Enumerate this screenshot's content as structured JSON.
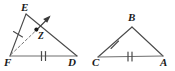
{
  "figure": {
    "background_color": "#ffffff",
    "stroke_color": "#4a4a4a",
    "label_color": "#1a1a1a",
    "triangles": [
      {
        "name": "triangle-EFD",
        "vertices": [
          {
            "label": "E",
            "x": 26,
            "y": 14
          },
          {
            "label": "F",
            "x": 10,
            "y": 56
          },
          {
            "label": "D",
            "x": 77,
            "y": 56
          }
        ],
        "sides": [
          {
            "from": "E",
            "to": "F",
            "ticks": 1
          },
          {
            "from": "F",
            "to": "D",
            "ticks": 2
          },
          {
            "from": "E",
            "to": "D",
            "ticks": 0
          }
        ],
        "interior_point": {
          "label": "Z",
          "x": 37,
          "y": 30
        },
        "ray": {
          "name": "angle-bisector-ray-F",
          "style": "dashed",
          "from": "F",
          "through": "Z",
          "arrow": true
        }
      },
      {
        "name": "triangle-BCA",
        "vertices": [
          {
            "label": "B",
            "x": 132,
            "y": 27
          },
          {
            "label": "C",
            "x": 98,
            "y": 57
          },
          {
            "label": "A",
            "x": 163,
            "y": 56
          }
        ],
        "sides": [
          {
            "from": "C",
            "to": "B",
            "ticks": 1
          },
          {
            "from": "C",
            "to": "A",
            "ticks": 2
          },
          {
            "from": "B",
            "to": "A",
            "ticks": 0
          }
        ]
      }
    ],
    "labels": {
      "E": "E",
      "F": "F",
      "D": "D",
      "Z": "Z",
      "B": "B",
      "C": "C",
      "A": "A"
    }
  }
}
